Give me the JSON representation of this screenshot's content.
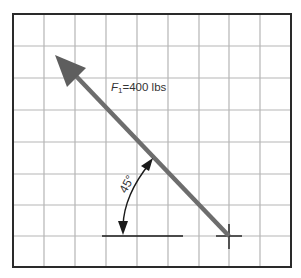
{
  "diagram": {
    "type": "force-vector-diagram",
    "force_label": {
      "symbol": "F",
      "subscript": "1",
      "value_text": "=400 lbs"
    },
    "angle_label": "45°",
    "angle_degrees": 45,
    "force_magnitude": 400,
    "force_unit": "lbs",
    "grid": {
      "columns": 9,
      "rows": 8
    },
    "colors": {
      "arrow": "#6d6d6d",
      "grid_line": "#b5b5b5",
      "border": "#2a2a2a",
      "text": "#333333"
    }
  }
}
